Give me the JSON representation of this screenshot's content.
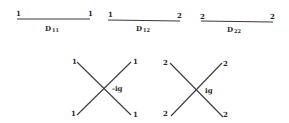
{
  "propagators": [
    {
      "name": "D",
      "subscript": "11",
      "left_label": "1",
      "right_label": "1"
    },
    {
      "name": "D",
      "subscript": "12",
      "left_label": "1",
      "right_label": "2"
    },
    {
      "name": "D",
      "subscript": "22",
      "left_label": "2",
      "right_label": "2"
    }
  ],
  "vertices": [
    {
      "coupling": "-ig",
      "legs": {
        "top_left": "1",
        "top_right": "1",
        "bottom_left": "1",
        "bottom_right": "1"
      }
    },
    {
      "coupling": "ig",
      "legs": {
        "top_left": "2",
        "top_right": "2",
        "bottom_left": "2",
        "bottom_right": "2"
      }
    }
  ],
  "colors": {
    "ink": "#2a2a2a",
    "background": "#ffffff"
  }
}
